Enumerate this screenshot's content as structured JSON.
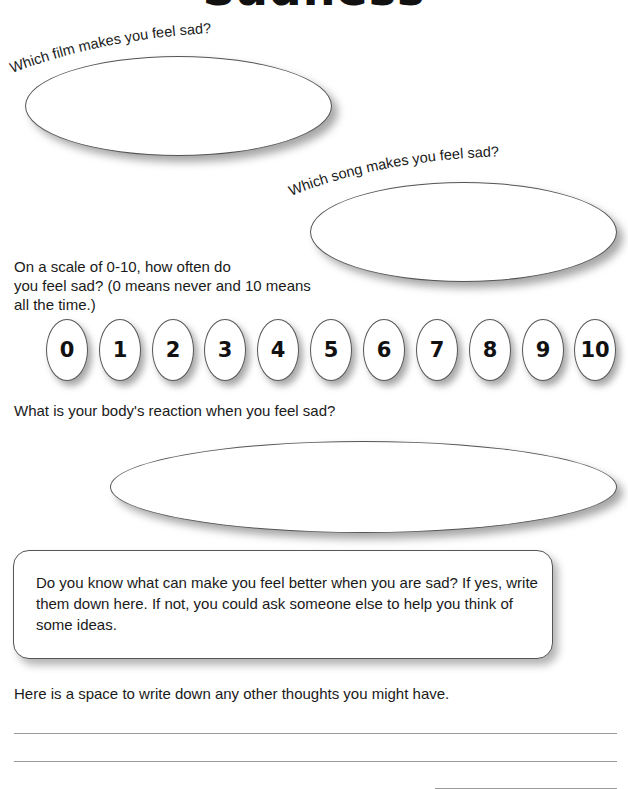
{
  "title": "Sadness",
  "questions": {
    "film": "Which film makes you feel sad?",
    "song": "Which song makes you feel sad?",
    "scale_prompt": "On a scale of 0-10, how often do you feel sad? (0 means never and 10 means all the time.)",
    "scale_lines": [
      "On a scale of 0-10, how often do",
      "you feel sad? (0 means never and 10 means",
      "all the time.)"
    ],
    "body_reaction": "What is your body's reaction when you feel sad?",
    "feel_better": "Do you know what can make you feel better when you are sad? If yes, write them down here. If not, you could ask someone else to help you think of some ideas.",
    "other_thoughts": "Here is a space to write down any other thoughts you might have."
  },
  "scale": {
    "options": [
      "0",
      "1",
      "2",
      "3",
      "4",
      "5",
      "6",
      "7",
      "8",
      "9",
      "10"
    ]
  },
  "answers": {
    "film": "",
    "song": "",
    "body_reaction": "",
    "feel_better": "",
    "other_thoughts_lines": 3
  }
}
